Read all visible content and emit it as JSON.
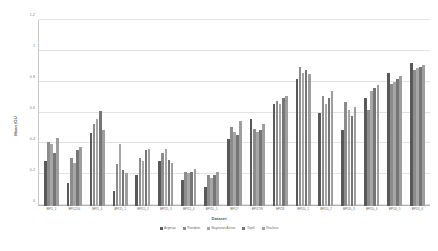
{
  "chart_data": {
    "type": "bar",
    "title": "",
    "xlabel": "Dataset",
    "ylabel": "Mean IOU",
    "ylim": [
      0,
      1.2
    ],
    "yticks": [
      "0",
      "0.2",
      "0.4",
      "0.6",
      "0.8",
      "1",
      "1.2"
    ],
    "ytick_values": [
      0,
      0.2,
      0.4,
      0.6,
      0.8,
      1.0,
      1.2
    ],
    "grid": true,
    "legend_position": "bottom",
    "categories": [
      "BPI1_1",
      "BPI1234",
      "BPI1_4",
      "BPI15_1",
      "BPI15_2",
      "BPI15_3",
      "BPI15_4",
      "BPI15_5",
      "BPI17",
      "BPI17W",
      "BPI23",
      "BPI20_1",
      "BPI20_2",
      "BPI20_3",
      "BPI20_4",
      "BPI20_5",
      "BPI20_6"
    ],
    "series": [
      {
        "name": "Argmax",
        "color": "#595959",
        "values": [
          0.29,
          0.15,
          0.47,
          0.1,
          0.2,
          0.29,
          0.17,
          0.12,
          0.43,
          0.56,
          0.66,
          0.82,
          0.6,
          0.49,
          0.7,
          0.86,
          0.92
        ]
      },
      {
        "name": "Random",
        "color": "#8c8c8c",
        "values": [
          0.41,
          0.31,
          0.53,
          0.27,
          0.31,
          0.34,
          0.22,
          0.2,
          0.51,
          0.5,
          0.68,
          0.9,
          0.71,
          0.67,
          0.62,
          0.79,
          0.88
        ]
      },
      {
        "name": "Bayesian Active",
        "color": "#a6a6a6",
        "values": [
          0.4,
          0.28,
          0.56,
          0.4,
          0.29,
          0.37,
          0.21,
          0.18,
          0.48,
          0.48,
          0.66,
          0.86,
          0.66,
          0.62,
          0.74,
          0.8,
          0.89
        ]
      },
      {
        "name": "TopK",
        "color": "#767676",
        "values": [
          0.34,
          0.36,
          0.61,
          0.23,
          0.36,
          0.3,
          0.22,
          0.2,
          0.46,
          0.49,
          0.7,
          0.88,
          0.7,
          0.58,
          0.76,
          0.82,
          0.9
        ]
      },
      {
        "name": "Nucleus",
        "color": "#9e9e9e",
        "values": [
          0.44,
          0.38,
          0.49,
          0.21,
          0.37,
          0.28,
          0.24,
          0.22,
          0.55,
          0.53,
          0.71,
          0.85,
          0.74,
          0.64,
          0.78,
          0.84,
          0.91
        ]
      }
    ]
  }
}
